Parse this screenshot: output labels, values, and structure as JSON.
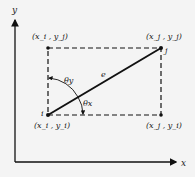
{
  "axes": {
    "x_label": "x",
    "y_label": "y"
  },
  "corners": {
    "top_left": "(x_i , y_j)",
    "top_right": "(x_j , y_j)",
    "bottom_left": "(x_i , y_i)",
    "bottom_right": "(x_j , y_i)"
  },
  "nodes": {
    "start": "i",
    "end": "j"
  },
  "element_label": "e",
  "angles": {
    "theta_x": "θx",
    "theta_y": "θy"
  },
  "colors": {
    "line": "#111111",
    "background": "#f4f4f4"
  }
}
